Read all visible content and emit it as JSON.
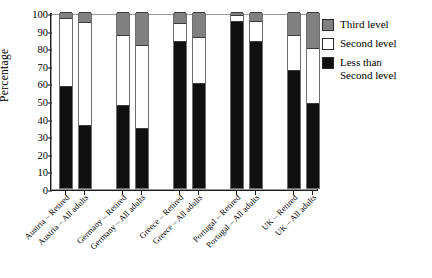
{
  "chart_data": {
    "type": "bar",
    "subtype": "stacked-bar-100",
    "title": "",
    "xlabel": "",
    "ylabel": "Percentage",
    "ylim": [
      0,
      100
    ],
    "yticks": [
      0,
      10,
      20,
      30,
      40,
      50,
      60,
      70,
      80,
      90,
      100
    ],
    "grid": false,
    "legend_position": "right",
    "categories": [
      "Austria – Retired",
      "Austria – All adults",
      "Germany – Retired",
      "Germany – All adults",
      "Greece – Retired",
      "Greece – All adults",
      "Portugal – Retired",
      "Portugal – All adults",
      "UK – Retired",
      "UK – All adults"
    ],
    "series": [
      {
        "name": "Less than Second level",
        "color": "#101010",
        "values": [
          57.5,
          35.0,
          46.5,
          33.5,
          83.0,
          59.0,
          94.5,
          83.0,
          66.5,
          47.5
        ]
      },
      {
        "name": "Second level",
        "color": "#ffffff",
        "values": [
          39.0,
          59.5,
          40.5,
          47.5,
          11.0,
          27.0,
          4.0,
          12.0,
          20.5,
          32.0
        ]
      },
      {
        "name": "Third level",
        "color": "#808080",
        "values": [
          3.5,
          5.5,
          13.0,
          19.0,
          6.0,
          14.0,
          1.5,
          5.0,
          13.0,
          20.5
        ]
      }
    ],
    "cumulative_tops": {
      "less_than_second": [
        57.5,
        35.0,
        46.5,
        33.5,
        83.0,
        59.0,
        94.5,
        83.0,
        66.5,
        47.5
      ],
      "second": [
        96.5,
        94.5,
        87.0,
        81.0,
        94.0,
        86.0,
        98.5,
        95.0,
        87.0,
        79.5
      ],
      "third": [
        100,
        100,
        100,
        100,
        100,
        100,
        100,
        100,
        100,
        100
      ]
    }
  },
  "legend": {
    "items": [
      {
        "label": "Third level",
        "swatch": "k3"
      },
      {
        "label": "Second level",
        "swatch": "k2"
      },
      {
        "label": "Less than\nSecond level",
        "swatch": "k1"
      }
    ],
    "item_0_label": "Third level",
    "item_1_label": "Second level",
    "item_2_label_line1": "Less than",
    "item_2_label_line2": "Second level"
  },
  "axis": {
    "y_title": "Percentage"
  },
  "colors": {
    "third_level": "#808080",
    "second_level": "#ffffff",
    "less_than_second_level": "#101010",
    "axis": "#1a1a1a",
    "frame": "#9a9a9a"
  }
}
